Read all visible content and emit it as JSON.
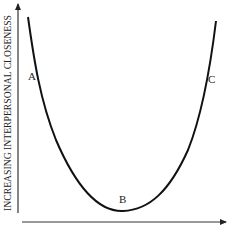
{
  "diagram": {
    "y_axis_label": "INCREASING INTERPERSONAL CLOSENESS",
    "x_axis_label": "",
    "curve_type": "U-shaped",
    "points": [
      {
        "label": "A",
        "position": "left descending branch"
      },
      {
        "label": "B",
        "position": "minimum"
      },
      {
        "label": "C",
        "position": "right ascending branch"
      }
    ]
  }
}
